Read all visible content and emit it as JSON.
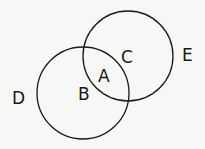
{
  "diagram": {
    "type": "venn",
    "sets": [
      {
        "id": "left",
        "region_label": "B"
      },
      {
        "id": "right",
        "region_label": "C"
      }
    ],
    "labels": {
      "intersection": "A",
      "left_only": "B",
      "right_only": "C",
      "outside_left": "D",
      "outside_right": "E"
    }
  }
}
